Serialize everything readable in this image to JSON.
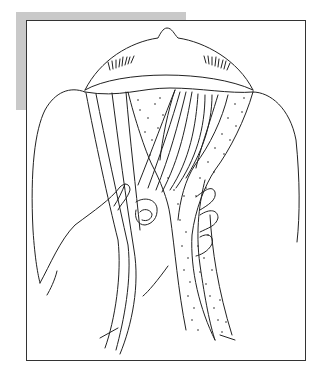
{
  "figure": {
    "colors": {
      "line": "#222222",
      "background": "#ffffff",
      "frame_border": "#333333",
      "shade": "#c9c9c9"
    },
    "elements": [
      "nose",
      "eyelashes-left",
      "eyelashes-right",
      "forehead-arc",
      "left-cheek-contour",
      "right-cheek-contour",
      "striated-muscle-strands",
      "dotted-flap-left",
      "dotted-flap-right",
      "hand",
      "thumb",
      "fingers"
    ]
  }
}
